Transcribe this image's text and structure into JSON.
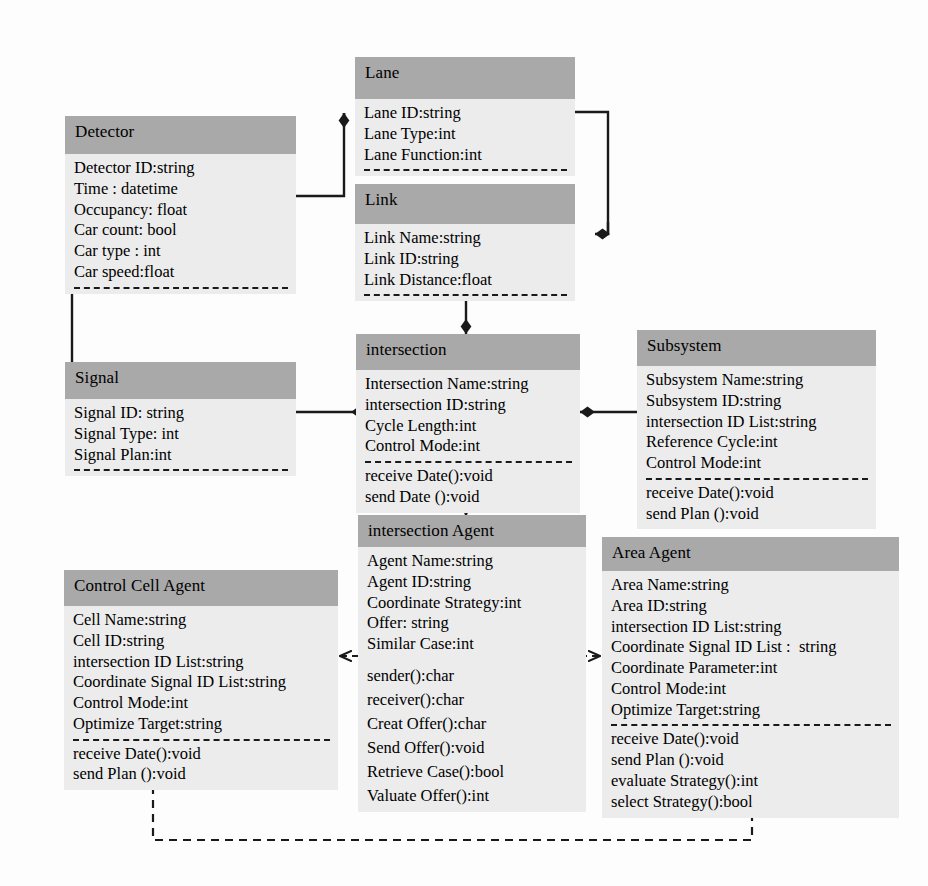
{
  "diagram": {
    "type": "uml-class-diagram",
    "colors": {
      "title_fill": "#a9a9a9",
      "body_fill": "#ececec",
      "line": "#1a1a1a",
      "background": "#fdfdfd"
    }
  },
  "classes": {
    "lane": {
      "name": "Lane",
      "attributes": [
        "Lane ID:string",
        "Lane Type:int",
        "Lane Function:int"
      ],
      "operations": []
    },
    "detector": {
      "name": "Detector",
      "attributes": [
        "Detector ID:string",
        "Time : datetime",
        "Occupancy: float",
        "Car count: bool",
        "Car type : int",
        "Car speed:float"
      ],
      "operations": []
    },
    "link": {
      "name": "Link",
      "attributes": [
        "Link Name:string",
        "Link ID:string",
        "Link Distance:float"
      ],
      "operations": []
    },
    "signal": {
      "name": "Signal",
      "attributes": [
        "Signal ID: string",
        "Signal Type: int",
        "Signal Plan:int"
      ],
      "operations": []
    },
    "intersection": {
      "name": "intersection",
      "attributes": [
        "Intersection Name:string",
        "intersection ID:string",
        "Cycle Length:int",
        "Control Mode:int"
      ],
      "operations": [
        "receive Date():void",
        "send Date ():void"
      ]
    },
    "subsystem": {
      "name": "Subsystem",
      "attributes": [
        "Subsystem Name:string",
        "Subsystem ID:string",
        "intersection ID List:string",
        "Reference Cycle:int",
        "Control Mode:int"
      ],
      "operations": [
        "receive Date():void",
        "send Plan ():void"
      ]
    },
    "intersection_agent": {
      "name": "intersection Agent",
      "attributes": [
        "Agent Name:string",
        "Agent ID:string",
        "Coordinate Strategy:int",
        "Offer: string",
        "Similar Case:int"
      ],
      "operations": [
        "sender():char",
        "receiver():char",
        "Creat Offer():char",
        "Send Offer():void",
        "Retrieve Case():bool",
        "Valuate Offer():int"
      ]
    },
    "area_agent": {
      "name": "Area Agent",
      "attributes": [
        "Area Name:string",
        "Area ID:string",
        "intersection ID List:string",
        "Coordinate Signal ID List :  string",
        "Coordinate Parameter:int",
        "Control Mode:int",
        "Optimize Target:string"
      ],
      "operations": [
        "receive Date():void",
        "send Plan ():void",
        "evaluate Strategy():int",
        "select Strategy():bool"
      ]
    },
    "control_cell_agent": {
      "name": "Control Cell Agent",
      "attributes": [
        "Cell Name:string",
        "Cell ID:string",
        "intersection ID List:string",
        "Coordinate Signal ID List:string",
        "Control Mode:int",
        "Optimize Target:string"
      ],
      "operations": [
        "receive Date():void",
        "send Plan ():void"
      ]
    }
  },
  "relationships": [
    {
      "id": "detector-lane",
      "from": "detector",
      "to": "lane",
      "kind": "composition",
      "marker": "filled-diamond"
    },
    {
      "id": "lane-link",
      "from": "lane",
      "to": "link",
      "kind": "composition",
      "marker": "filled-diamond"
    },
    {
      "id": "link-intersection",
      "from": "link",
      "to": "intersection",
      "kind": "composition",
      "marker": "filled-diamond"
    },
    {
      "id": "detector-signal",
      "from": "detector",
      "to": "signal",
      "kind": "association",
      "marker": "open-arrow"
    },
    {
      "id": "signal-intersection",
      "from": "signal",
      "to": "intersection",
      "kind": "composition",
      "marker": "filled-diamond"
    },
    {
      "id": "subsystem-intersection",
      "from": "subsystem",
      "to": "intersection",
      "kind": "composition",
      "marker": "filled-diamond"
    },
    {
      "id": "intersection-agent-generalization",
      "from": "intersection_agent",
      "to": "intersection",
      "kind": "generalization",
      "marker": "hollow-triangle"
    },
    {
      "id": "cell-agent-area-agent-dependency",
      "from": "control_cell_agent",
      "to": "area_agent",
      "kind": "dependency",
      "marker": "bidirectional-dashed-arrow"
    },
    {
      "id": "cell-agent-area-agent-link",
      "from": "control_cell_agent",
      "to": "area_agent",
      "kind": "dashed-link",
      "marker": "none"
    }
  ]
}
